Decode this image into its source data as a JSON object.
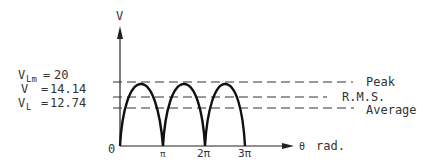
{
  "diagram": {
    "type": "full-wave rectified sine waveform",
    "y_axis_label": "V",
    "x_axis_label_symbol": "θ",
    "x_axis_unit": "rad.",
    "origin_label": "0",
    "x_ticks": [
      "π",
      "2π",
      "3π"
    ],
    "levels": [
      {
        "name": "Peak",
        "label": "Peak"
      },
      {
        "name": "rms",
        "label": "R.M.S."
      },
      {
        "name": "average",
        "label": "Average"
      }
    ],
    "equations": [
      {
        "symbol": "V",
        "subscript": "Lm",
        "eq": "=",
        "value": "20"
      },
      {
        "symbol": "V",
        "subscript": "",
        "eq": "=",
        "value": "14.14"
      },
      {
        "symbol": "V",
        "subscript": "L",
        "eq": "=",
        "value": "12.74"
      }
    ]
  }
}
